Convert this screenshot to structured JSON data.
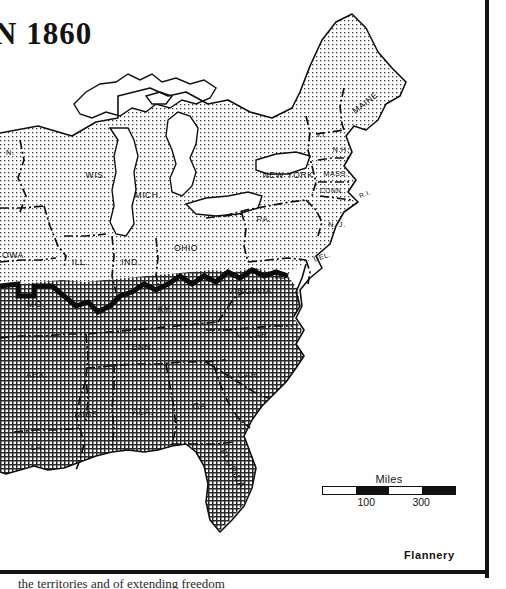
{
  "map": {
    "title": "N 1860",
    "signature": "Flannery",
    "caption_partial": "the territories and of extending freedom",
    "scale": {
      "caption": "Miles",
      "ticks": [
        "100",
        "300"
      ],
      "tick_positions_pct": [
        33,
        74
      ]
    },
    "colors": {
      "ink": "#111111",
      "paper": "#ffffff",
      "free_state_fill": "#e6e6e6",
      "slave_state_fill": "#9a9a9a",
      "water_fill": "#ffffff"
    },
    "regions": {
      "free_states_label": "free states (light stipple)",
      "slave_states_label": "slave states (dark crosshatch)"
    },
    "state_labels": [
      {
        "name": "N.",
        "x": 6,
        "y": 155,
        "size": 7.5,
        "rot": 0,
        "anchor": "start"
      },
      {
        "name": "WIS.",
        "x": 96,
        "y": 178,
        "size": 8.5,
        "rot": 0,
        "anchor": "middle"
      },
      {
        "name": "MICH.",
        "x": 148,
        "y": 198,
        "size": 8.5,
        "rot": 0,
        "anchor": "middle"
      },
      {
        "name": "OWA",
        "x": 2,
        "y": 258,
        "size": 8.5,
        "rot": 0,
        "anchor": "start"
      },
      {
        "name": "ILL.",
        "x": 80,
        "y": 265,
        "size": 8.5,
        "rot": 0,
        "anchor": "middle"
      },
      {
        "name": "IND.",
        "x": 131,
        "y": 265,
        "size": 8.5,
        "rot": 0,
        "anchor": "middle"
      },
      {
        "name": "OHIO",
        "x": 186,
        "y": 251,
        "size": 8.5,
        "rot": 0,
        "anchor": "middle"
      },
      {
        "name": "PA.",
        "x": 264,
        "y": 222,
        "size": 8.5,
        "rot": 0,
        "anchor": "middle"
      },
      {
        "name": "NEW YORK",
        "x": 288,
        "y": 178,
        "size": 8.5,
        "rot": 0,
        "anchor": "middle"
      },
      {
        "name": "MAINE",
        "x": 367,
        "y": 105,
        "size": 8.5,
        "rot": -38,
        "anchor": "middle"
      },
      {
        "name": "VT.",
        "x": 322,
        "y": 137,
        "size": 7,
        "rot": 0,
        "anchor": "middle"
      },
      {
        "name": "N.H.",
        "x": 341,
        "y": 152,
        "size": 7,
        "rot": 0,
        "anchor": "middle"
      },
      {
        "name": "MASS.",
        "x": 336,
        "y": 176,
        "size": 7,
        "rot": 0,
        "anchor": "middle"
      },
      {
        "name": "CONN.",
        "x": 332,
        "y": 193,
        "size": 6.5,
        "rot": 0,
        "anchor": "middle"
      },
      {
        "name": "R.I.",
        "x": 366,
        "y": 196,
        "size": 6.5,
        "rot": -22,
        "anchor": "middle"
      },
      {
        "name": "N. J.",
        "x": 337,
        "y": 227,
        "size": 7,
        "rot": 0,
        "anchor": "middle"
      },
      {
        "name": "MD.",
        "x": 282,
        "y": 279,
        "size": 7,
        "rot": 0,
        "anchor": "middle"
      },
      {
        "name": "DEL.",
        "x": 323,
        "y": 259,
        "size": 7,
        "rot": -18,
        "anchor": "middle"
      },
      {
        "name": "MO.",
        "x": 36,
        "y": 307,
        "size": 8.5,
        "rot": 0,
        "anchor": "middle"
      },
      {
        "name": "KY.",
        "x": 165,
        "y": 312,
        "size": 8.5,
        "rot": 0,
        "anchor": "middle"
      },
      {
        "name": "VIRGINIA",
        "x": 250,
        "y": 294,
        "size": 9,
        "rot": 0,
        "anchor": "middle"
      },
      {
        "name": "TENN.",
        "x": 140,
        "y": 350,
        "size": 8.5,
        "rot": 0,
        "anchor": "middle"
      },
      {
        "name": "N. CAR.",
        "x": 253,
        "y": 338,
        "size": 8.5,
        "rot": 0,
        "anchor": "middle"
      },
      {
        "name": "ARK.",
        "x": 37,
        "y": 378,
        "size": 8.5,
        "rot": 0,
        "anchor": "middle"
      },
      {
        "name": "S. CAR.",
        "x": 243,
        "y": 378,
        "size": 8.5,
        "rot": 0,
        "anchor": "middle"
      },
      {
        "name": "MISS.",
        "x": 88,
        "y": 417,
        "size": 8.5,
        "rot": 0,
        "anchor": "middle"
      },
      {
        "name": "ALA.",
        "x": 143,
        "y": 415,
        "size": 8.5,
        "rot": 0,
        "anchor": "middle"
      },
      {
        "name": "GA.",
        "x": 201,
        "y": 409,
        "size": 8.5,
        "rot": 0,
        "anchor": "middle"
      },
      {
        "name": "LA.",
        "x": 38,
        "y": 450,
        "size": 8.5,
        "rot": 0,
        "anchor": "middle"
      },
      {
        "name": "FLORIDA",
        "x": 230,
        "y": 470,
        "size": 9,
        "rot": 62,
        "anchor": "middle"
      }
    ]
  }
}
